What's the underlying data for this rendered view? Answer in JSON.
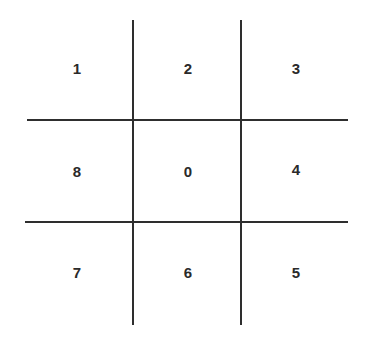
{
  "diagram": {
    "type": "3x3 grid",
    "grid": [
      [
        "1",
        "2",
        "3"
      ],
      [
        "8",
        "0",
        "4"
      ],
      [
        "7",
        "6",
        "5"
      ]
    ],
    "colors": {
      "line": "#2e2e2e",
      "text": "#2a2a2a",
      "background": "#ffffff"
    }
  }
}
